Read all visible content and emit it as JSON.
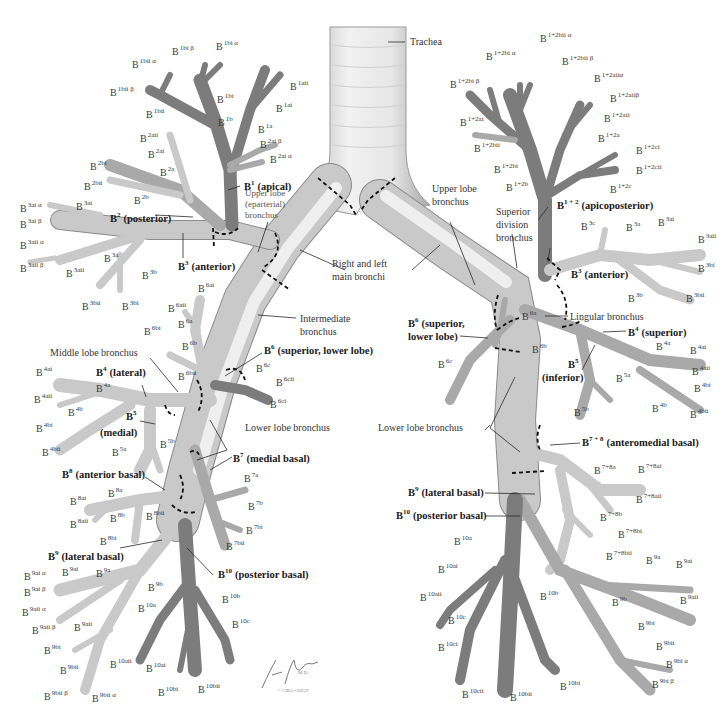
{
  "figure": {
    "signature": "F. Netter M.D.",
    "copyright": "© CIBA-GEIGY"
  },
  "center": {
    "trachea": "Trachea",
    "main_bronchi_1": "Right and left",
    "main_bronchi_2": "main bronchi",
    "intermediate_1": "Intermediate",
    "intermediate_2": "bronchus"
  },
  "right_lung": {
    "upper_lobe_1": "Upper lobe",
    "upper_lobe_2": "(eparterial)",
    "upper_lobe_3": "bronchus",
    "middle_lobe": "Middle lobe bronchus",
    "lower_lobe": "Lower lobe bronchus",
    "segments": {
      "b1": {
        "base": "B",
        "sup": "1",
        "name": "(apical)"
      },
      "b2": {
        "base": "B",
        "sup": "2",
        "name": "(posterior)"
      },
      "b3": {
        "base": "B",
        "sup": "3",
        "name": "(anterior)"
      },
      "b4": {
        "base": "B",
        "sup": "4",
        "name": "(lateral)"
      },
      "b5": {
        "base": "B",
        "sup": "5",
        "name": "(medial)"
      },
      "b6": {
        "base": "B",
        "sup": "6",
        "name": "(superior, lower lobe)"
      },
      "b7": {
        "base": "B",
        "sup": "7",
        "name": "(medial basal)"
      },
      "b8": {
        "base": "B",
        "sup": "8",
        "name": "(anterior basal)"
      },
      "b9": {
        "base": "B",
        "sup": "9",
        "name": "(lateral basal)"
      },
      "b10": {
        "base": "B",
        "sup": "10",
        "name": "(posterior basal)"
      }
    },
    "subsegments": [
      {
        "sup": "1bii α",
        "x": 132,
        "y": 68
      },
      {
        "sup": "1bi β",
        "x": 172,
        "y": 55
      },
      {
        "sup": "1bi α",
        "x": 216,
        "y": 50
      },
      {
        "sup": "1bii β",
        "x": 110,
        "y": 96
      },
      {
        "sup": "1bi",
        "x": 217,
        "y": 103
      },
      {
        "sup": "1aii",
        "x": 290,
        "y": 90
      },
      {
        "sup": "1ai",
        "x": 276,
        "y": 112
      },
      {
        "sup": "1bii",
        "x": 146,
        "y": 118
      },
      {
        "sup": "1b",
        "x": 218,
        "y": 126
      },
      {
        "sup": "1a",
        "x": 258,
        "y": 133
      },
      {
        "sup": "2aii",
        "x": 140,
        "y": 142
      },
      {
        "sup": "2ai β",
        "x": 260,
        "y": 148
      },
      {
        "sup": "2ai",
        "x": 148,
        "y": 158
      },
      {
        "sup": "2ai α",
        "x": 270,
        "y": 163
      },
      {
        "sup": "2bi",
        "x": 90,
        "y": 170
      },
      {
        "sup": "2a",
        "x": 160,
        "y": 176
      },
      {
        "sup": "2bii",
        "x": 84,
        "y": 190
      },
      {
        "sup": "2b",
        "x": 134,
        "y": 204
      },
      {
        "sup": "3ai α",
        "x": 20,
        "y": 212
      },
      {
        "sup": "3ai",
        "x": 76,
        "y": 210
      },
      {
        "sup": "3ai β",
        "x": 20,
        "y": 228
      },
      {
        "sup": "3aii α",
        "x": 20,
        "y": 249
      },
      {
        "sup": "3a",
        "x": 104,
        "y": 262
      },
      {
        "sup": "3b",
        "x": 142,
        "y": 279
      },
      {
        "sup": "3aii β",
        "x": 20,
        "y": 272
      },
      {
        "sup": "3aii",
        "x": 66,
        "y": 277
      },
      {
        "sup": "3bii",
        "x": 82,
        "y": 310
      },
      {
        "sup": "3bi",
        "x": 122,
        "y": 310
      },
      {
        "sup": "6ai",
        "x": 198,
        "y": 292
      },
      {
        "sup": "6aii",
        "x": 168,
        "y": 312
      },
      {
        "sup": "6a",
        "x": 178,
        "y": 328
      },
      {
        "sup": "6bi",
        "x": 144,
        "y": 335
      },
      {
        "sup": "6b",
        "x": 182,
        "y": 350
      },
      {
        "sup": "6bii",
        "x": 178,
        "y": 380
      },
      {
        "sup": "6c",
        "x": 256,
        "y": 372
      },
      {
        "sup": "6cii",
        "x": 276,
        "y": 386
      },
      {
        "sup": "6ci",
        "x": 270,
        "y": 408
      },
      {
        "sup": "4ai",
        "x": 36,
        "y": 376
      },
      {
        "sup": "4a",
        "x": 96,
        "y": 392
      },
      {
        "sup": "4aii",
        "x": 34,
        "y": 403
      },
      {
        "sup": "4b",
        "x": 68,
        "y": 416
      },
      {
        "sup": "4bi",
        "x": 36,
        "y": 432
      },
      {
        "sup": "4bii",
        "x": 42,
        "y": 456
      },
      {
        "sup": "5a",
        "x": 112,
        "y": 456
      },
      {
        "sup": "5b",
        "x": 160,
        "y": 448
      },
      {
        "sup": "7a",
        "x": 244,
        "y": 482
      },
      {
        "sup": "7b",
        "x": 248,
        "y": 510
      },
      {
        "sup": "7bi",
        "x": 246,
        "y": 534
      },
      {
        "sup": "7bii",
        "x": 226,
        "y": 550
      },
      {
        "sup": "8a",
        "x": 108,
        "y": 497
      },
      {
        "sup": "8ai",
        "x": 70,
        "y": 505
      },
      {
        "sup": "8aii",
        "x": 70,
        "y": 528
      },
      {
        "sup": "8b",
        "x": 110,
        "y": 522
      },
      {
        "sup": "8bii",
        "x": 146,
        "y": 520
      },
      {
        "sup": "8bi",
        "x": 100,
        "y": 545
      },
      {
        "sup": "9ai α",
        "x": 24,
        "y": 580
      },
      {
        "sup": "9ai",
        "x": 62,
        "y": 576
      },
      {
        "sup": "9a",
        "x": 96,
        "y": 577
      },
      {
        "sup": "9ai β",
        "x": 24,
        "y": 596
      },
      {
        "sup": "9b",
        "x": 148,
        "y": 591
      },
      {
        "sup": "9aii α",
        "x": 22,
        "y": 616
      },
      {
        "sup": "9aii β",
        "x": 32,
        "y": 634
      },
      {
        "sup": "9aii",
        "x": 74,
        "y": 631
      },
      {
        "sup": "9bi",
        "x": 44,
        "y": 654
      },
      {
        "sup": "9bii",
        "x": 60,
        "y": 674
      },
      {
        "sup": "9bii β",
        "x": 44,
        "y": 700
      },
      {
        "sup": "9bii α",
        "x": 92,
        "y": 702
      },
      {
        "sup": "10a",
        "x": 138,
        "y": 612
      },
      {
        "sup": "10b",
        "x": 222,
        "y": 603
      },
      {
        "sup": "10c",
        "x": 232,
        "y": 628
      },
      {
        "sup": "10aii",
        "x": 110,
        "y": 668
      },
      {
        "sup": "10ai",
        "x": 146,
        "y": 672
      },
      {
        "sup": "10bi",
        "x": 158,
        "y": 696
      },
      {
        "sup": "10bii",
        "x": 198,
        "y": 693
      }
    ]
  },
  "left_lung": {
    "upper_lobe_1": "Upper lobe",
    "upper_lobe_2": "bronchus",
    "superior_div_1": "Superior",
    "superior_div_2": "division",
    "superior_div_3": "bronchus",
    "lingular": "Lingular bronchus",
    "lower_lobe": "Lower lobe bronchus",
    "segments": {
      "b12": {
        "base": "B",
        "sup": "1 + 2",
        "name": "(apicoposterior)"
      },
      "b3": {
        "base": "B",
        "sup": "3",
        "name": "(anterior)"
      },
      "b4": {
        "base": "B",
        "sup": "4",
        "name": "(superior)"
      },
      "b5": {
        "base": "B",
        "sup": "5",
        "name": "(inferior)"
      },
      "b6_line1": {
        "base": "B",
        "sup": "6",
        "name": "(superior,"
      },
      "b6_line2": "lower lobe)",
      "b78": {
        "base": "B",
        "sup": "7 + 8",
        "name": "(anteromedial basal)"
      },
      "b9": {
        "base": "B",
        "sup": "9",
        "name": "(lateral basal)"
      },
      "b10": {
        "base": "B",
        "sup": "10",
        "name": "(posterior basal)"
      }
    },
    "subsegments": [
      {
        "sup": "1+2bii α",
        "x": 540,
        "y": 42
      },
      {
        "sup": "1+2bi α",
        "x": 486,
        "y": 60
      },
      {
        "sup": "1+2bii β",
        "x": 562,
        "y": 65
      },
      {
        "sup": "1+2aiiα",
        "x": 594,
        "y": 82
      },
      {
        "sup": "1+2bi β",
        "x": 450,
        "y": 88
      },
      {
        "sup": "1+2aiiβ",
        "x": 610,
        "y": 102
      },
      {
        "sup": "1+2ai",
        "x": 460,
        "y": 126
      },
      {
        "sup": "1+2aii",
        "x": 604,
        "y": 122
      },
      {
        "sup": "1+2a",
        "x": 598,
        "y": 142
      },
      {
        "sup": "1+2bii",
        "x": 474,
        "y": 152
      },
      {
        "sup": "1+2ci",
        "x": 636,
        "y": 154
      },
      {
        "sup": "1+2bi",
        "x": 494,
        "y": 173
      },
      {
        "sup": "1+2cii",
        "x": 636,
        "y": 174
      },
      {
        "sup": "1+2b",
        "x": 506,
        "y": 191
      },
      {
        "sup": "1+2c",
        "x": 610,
        "y": 193
      },
      {
        "sup": "3c",
        "x": 581,
        "y": 230
      },
      {
        "sup": "3a",
        "x": 626,
        "y": 231
      },
      {
        "sup": "3ai",
        "x": 658,
        "y": 226
      },
      {
        "sup": "3aii",
        "x": 698,
        "y": 243
      },
      {
        "sup": "3bi",
        "x": 698,
        "y": 272
      },
      {
        "sup": "3b",
        "x": 628,
        "y": 302
      },
      {
        "sup": "3bii",
        "x": 686,
        "y": 302
      },
      {
        "sup": "6a",
        "x": 522,
        "y": 320
      },
      {
        "sup": "6b",
        "x": 532,
        "y": 353
      },
      {
        "sup": "6c",
        "x": 438,
        "y": 368
      },
      {
        "sup": "4a",
        "x": 656,
        "y": 350
      },
      {
        "sup": "4ai",
        "x": 690,
        "y": 354
      },
      {
        "sup": "4aii",
        "x": 692,
        "y": 375
      },
      {
        "sup": "4bi",
        "x": 694,
        "y": 392
      },
      {
        "sup": "5a",
        "x": 616,
        "y": 382
      },
      {
        "sup": "4b",
        "x": 652,
        "y": 412
      },
      {
        "sup": "4bii",
        "x": 690,
        "y": 418
      },
      {
        "sup": "5b",
        "x": 574,
        "y": 416
      },
      {
        "sup": "7+8a",
        "x": 594,
        "y": 474
      },
      {
        "sup": "7+8ai",
        "x": 638,
        "y": 473
      },
      {
        "sup": "7+8aii",
        "x": 636,
        "y": 503
      },
      {
        "sup": "7+8b",
        "x": 600,
        "y": 521
      },
      {
        "sup": "7+8bi",
        "x": 618,
        "y": 538
      },
      {
        "sup": "7+8bii",
        "x": 606,
        "y": 560
      },
      {
        "sup": "10a",
        "x": 454,
        "y": 545
      },
      {
        "sup": "9a",
        "x": 646,
        "y": 564
      },
      {
        "sup": "9ai",
        "x": 676,
        "y": 568
      },
      {
        "sup": "10ai",
        "x": 438,
        "y": 573
      },
      {
        "sup": "10aii",
        "x": 420,
        "y": 601
      },
      {
        "sup": "9aii",
        "x": 680,
        "y": 604
      },
      {
        "sup": "10b",
        "x": 540,
        "y": 600
      },
      {
        "sup": "9b",
        "x": 612,
        "y": 606
      },
      {
        "sup": "10c",
        "x": 448,
        "y": 624
      },
      {
        "sup": "9bi",
        "x": 638,
        "y": 630
      },
      {
        "sup": "9bii",
        "x": 656,
        "y": 650
      },
      {
        "sup": "10ci",
        "x": 438,
        "y": 651
      },
      {
        "sup": "9bi α",
        "x": 666,
        "y": 668
      },
      {
        "sup": "10cii",
        "x": 462,
        "y": 698
      },
      {
        "sup": "10bi",
        "x": 560,
        "y": 690
      },
      {
        "sup": "10bii",
        "x": 510,
        "y": 701
      },
      {
        "sup": "9bi β",
        "x": 652,
        "y": 688
      }
    ]
  }
}
